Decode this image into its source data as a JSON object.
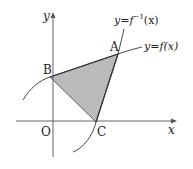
{
  "diagram": {
    "axes": {
      "x_label": "x",
      "y_label": "y",
      "origin_label": "O"
    },
    "curves": [
      {
        "name": "f",
        "label_lhs": "y",
        "label_eq": "=",
        "label_rhs": "f(x)"
      },
      {
        "name": "f-inverse",
        "label_lhs": "y",
        "label_eq": "=",
        "label_fn": "f",
        "label_sup": "−1",
        "label_arg": "(x)"
      }
    ],
    "points": {
      "A": "A",
      "B": "B",
      "C": "C"
    },
    "shaded_region": "triangle ABC",
    "colors": {
      "shade": "#b4b4b4",
      "line": "#333333",
      "axis": "#555555"
    }
  }
}
